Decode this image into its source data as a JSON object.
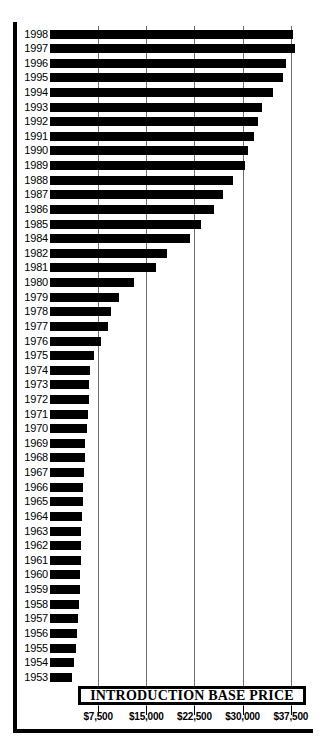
{
  "chart_data": {
    "type": "bar",
    "orientation": "horizontal",
    "title": "INTRODUCTION BASE PRICE",
    "xlabel": "",
    "ylabel": "",
    "xlim": [
      0,
      39500
    ],
    "grid": true,
    "legend": false,
    "xticks": [
      7500,
      15000,
      22500,
      30000,
      37500
    ],
    "xtick_labels": [
      "$7,500",
      "$15,000",
      "$22,500",
      "$30,000",
      "$37,500"
    ],
    "categories": [
      "1998",
      "1997",
      "1996",
      "1995",
      "1994",
      "1993",
      "1992",
      "1991",
      "1990",
      "1989",
      "1988",
      "1987",
      "1986",
      "1985",
      "1984",
      "1982",
      "1981",
      "1980",
      "1979",
      "1978",
      "1977",
      "1976",
      "1975",
      "1974",
      "1973",
      "1972",
      "1971",
      "1970",
      "1969",
      "1968",
      "1967",
      "1966",
      "1965",
      "1964",
      "1963",
      "1962",
      "1961",
      "1960",
      "1959",
      "1958",
      "1957",
      "1956",
      "1955",
      "1954",
      "1953"
    ],
    "values": [
      37800,
      38200,
      36800,
      36300,
      34700,
      33000,
      32400,
      31700,
      30800,
      30300,
      28500,
      27000,
      25500,
      23500,
      21800,
      18300,
      16500,
      13100,
      10800,
      9500,
      9000,
      7900,
      6900,
      6300,
      6100,
      6000,
      5900,
      5700,
      5500,
      5400,
      5300,
      5200,
      5100,
      5000,
      4900,
      4900,
      4800,
      4700,
      4600,
      4500,
      4300,
      4200,
      4000,
      3700,
      3500
    ],
    "bar_color": "#000000",
    "gridline_color": "#6e6e6e"
  }
}
